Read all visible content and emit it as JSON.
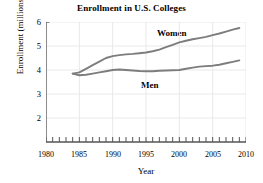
{
  "chart_data": {
    "type": "line",
    "title": "Enrollment in U.S. Colleges",
    "xlabel": "Year",
    "ylabel": "Enrollment (millions)",
    "xlim": [
      1980,
      2010
    ],
    "ylim": [
      1.5,
      6
    ],
    "grid": true,
    "legend_position": "inline-annotation",
    "x_major_ticks": [
      1980,
      1985,
      1990,
      1995,
      2000,
      2005,
      2010
    ],
    "x_minor_tick_step": 1,
    "y_major_ticks": [
      2,
      3,
      4,
      5,
      6
    ],
    "x_tick_labels": [
      "1980",
      "1985",
      "1990",
      "1995",
      "2000",
      "2005",
      "2010"
    ],
    "y_tick_labels": [
      "2",
      "3",
      "4",
      "5",
      "6"
    ],
    "line_color": "#7d7d7d",
    "series": [
      {
        "name": "Women",
        "x": [
          1984,
          1985,
          1986,
          1987,
          1988,
          1989,
          1990,
          1991,
          1992,
          1993,
          1994,
          1995,
          1996,
          1997,
          1998,
          1999,
          2000,
          2001,
          2002,
          2003,
          2004,
          2005,
          2006,
          2007,
          2008,
          2009
        ],
        "values": [
          3.85,
          3.9,
          4.05,
          4.2,
          4.35,
          4.5,
          4.58,
          4.62,
          4.65,
          4.67,
          4.7,
          4.73,
          4.78,
          4.85,
          4.95,
          5.05,
          5.15,
          5.22,
          5.28,
          5.33,
          5.38,
          5.45,
          5.52,
          5.6,
          5.68,
          5.75
        ]
      },
      {
        "name": "Men",
        "x": [
          1984,
          1985,
          1986,
          1987,
          1988,
          1989,
          1990,
          1991,
          1992,
          1993,
          1994,
          1995,
          1996,
          1997,
          1998,
          1999,
          2000,
          2001,
          2002,
          2003,
          2004,
          2005,
          2006,
          2007,
          2008,
          2009
        ],
        "values": [
          3.85,
          3.78,
          3.8,
          3.85,
          3.9,
          3.95,
          4.0,
          4.02,
          4.0,
          3.98,
          3.96,
          3.95,
          3.95,
          3.97,
          3.98,
          3.99,
          4.0,
          4.05,
          4.1,
          4.14,
          4.16,
          4.18,
          4.22,
          4.28,
          4.34,
          4.4
        ]
      }
    ],
    "annotations": [
      {
        "label": "Women",
        "x": 2000,
        "y": 5.6
      },
      {
        "label": "Men",
        "x": 1995.5,
        "y": 3.45
      }
    ]
  }
}
